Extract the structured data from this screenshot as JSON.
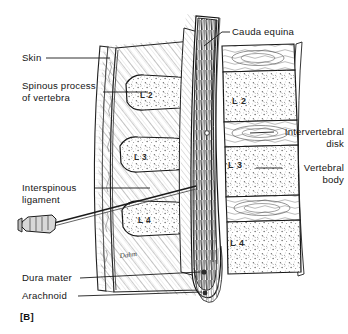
{
  "figure": {
    "panel_letter": "[B]",
    "background_color": "#ffffff",
    "ink_color": "#1a1a1a",
    "signature": "Dahm"
  },
  "labels_left": [
    {
      "id": "skin",
      "text": "Skin",
      "x": 22,
      "y": 52
    },
    {
      "id": "spinous-process",
      "text": "Spinous process\nof vertebra",
      "x": 22,
      "y": 80
    },
    {
      "id": "interspinous-ligament",
      "text": "Interspinous\nligament",
      "x": 22,
      "y": 182
    },
    {
      "id": "dura-mater",
      "text": "Dura mater",
      "x": 22,
      "y": 274
    },
    {
      "id": "arachnoid",
      "text": "Arachnoid",
      "x": 22,
      "y": 292
    }
  ],
  "labels_right": [
    {
      "id": "cauda-equina",
      "text": "Cauda equina",
      "x": 232,
      "y": 26
    },
    {
      "id": "intervertebral-disk",
      "text": "Intervertebral\ndisk",
      "x": 278,
      "y": 126
    },
    {
      "id": "vertebral-body",
      "text": "Vertebral\nbody",
      "x": 286,
      "y": 162
    }
  ],
  "spinous_processes": [
    {
      "id": "sp-l2",
      "text": "L 2",
      "x": 140,
      "y": 96
    },
    {
      "id": "sp-l3",
      "text": "L 3",
      "x": 134,
      "y": 157
    },
    {
      "id": "sp-l4",
      "text": "L 4",
      "x": 138,
      "y": 220
    }
  ],
  "vertebral_bodies": [
    {
      "id": "vb-l2",
      "text": "L 2",
      "x": 232,
      "y": 101
    },
    {
      "id": "vb-l3",
      "text": "L 3",
      "x": 228,
      "y": 164
    },
    {
      "id": "vb-l4",
      "text": "L 4",
      "x": 230,
      "y": 232
    }
  ],
  "structures": {
    "needle": "lumbar-puncture-needle",
    "skin_layer": "skin",
    "muscle_layer": "paraspinal-muscle-hatching",
    "spinal_canal": "cauda-equina-nerve-roots",
    "dural_sac": "dural-sac-terminating-caudally"
  }
}
